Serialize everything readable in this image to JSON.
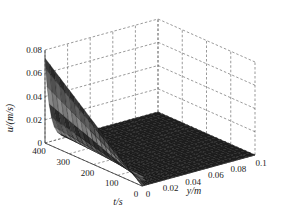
{
  "chart_data": {
    "type": "surface3d",
    "title": "",
    "xlabel": "y/m",
    "ylabel": "t/s",
    "zlabel": "u/(m/s)",
    "x_ticks": [
      "0",
      "0.02",
      "0.04",
      "0.06",
      "0.08",
      "0.1"
    ],
    "y_ticks": [
      "0",
      "100",
      "200",
      "300",
      "400"
    ],
    "z_ticks": [
      "0",
      "0.02",
      "0.04",
      "0.06",
      "0.08"
    ],
    "xlim": [
      0,
      0.1
    ],
    "ylim": [
      0,
      400
    ],
    "zlim": [
      0,
      0.08
    ],
    "grid": true,
    "surface_samples": {
      "y": [
        0,
        0.005,
        0.01,
        0.02,
        0.05,
        0.1
      ],
      "t": [
        0,
        100,
        200,
        300,
        400
      ],
      "u": [
        [
          0.0,
          0.0,
          0.0,
          0.0,
          0.0,
          0.0
        ],
        [
          0.018,
          0.008,
          0.002,
          0.0,
          0.0,
          0.0
        ],
        [
          0.037,
          0.017,
          0.005,
          0.0,
          0.0,
          0.0
        ],
        [
          0.055,
          0.026,
          0.008,
          0.0,
          0.0,
          0.0
        ],
        [
          0.073,
          0.035,
          0.011,
          0.0,
          0.0,
          0.0
        ]
      ]
    }
  },
  "labels": {
    "z_axis": "u/(m/s)",
    "t_axis": "t/s",
    "y_axis": "y/m"
  }
}
